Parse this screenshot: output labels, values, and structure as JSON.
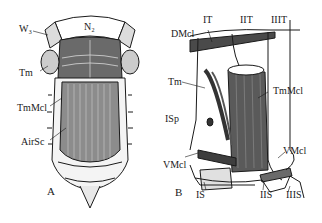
{
  "figure": {
    "panels": [
      {
        "id": "A",
        "label": "A",
        "labels": {
          "w3": "W₃",
          "n2": "N₂",
          "tm": "Tm",
          "tmmcl": "TmMcl",
          "airsc": "AirSc"
        }
      },
      {
        "id": "B",
        "label": "B",
        "labels": {
          "it": "IT",
          "iit": "IIT",
          "iiit": "IIIT",
          "dmcl": "DMcl",
          "tm": "Tm",
          "tmmcl": "TmMcl",
          "isp": "ISp",
          "vmcl_left": "VMcl",
          "vmcl_right": "VMcl",
          "is": "IS",
          "iis": "IIS",
          "iiis": "IIIS"
        }
      }
    ],
    "colors": {
      "ink": "#1a1a1a",
      "shade": "#555555",
      "light": "#bdbdbd",
      "paper": "#ffffff"
    }
  }
}
